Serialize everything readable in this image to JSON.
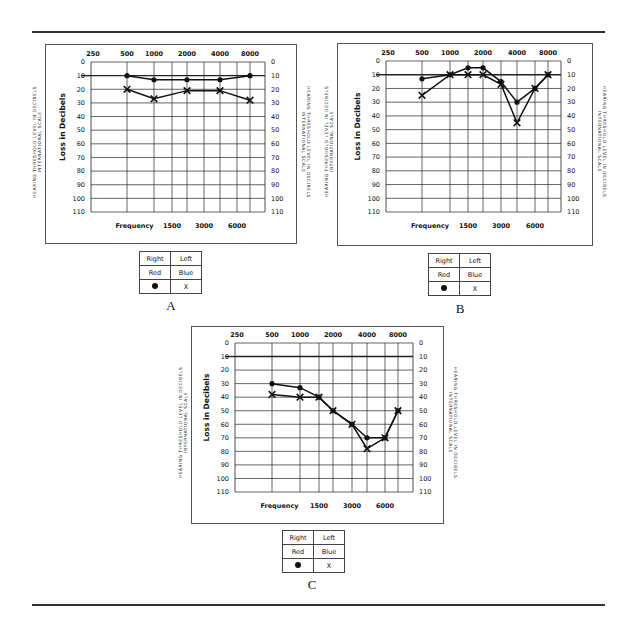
{
  "page": {
    "legend": {
      "right": "Right",
      "left": "Left",
      "right_color": "Red",
      "left_color": "Blue",
      "right_symbol": "●",
      "left_symbol": "X"
    },
    "axis_common": {
      "top_freq_labels": [
        "250",
        "500",
        "1000",
        "2000",
        "4000",
        "8000"
      ],
      "bottom_freq_labels": [
        "1500",
        "3000",
        "6000"
      ],
      "frequency_label": "Frequency",
      "db_ticks": [
        "0",
        "10",
        "20",
        "30",
        "40",
        "50",
        "60",
        "70",
        "80",
        "90",
        "100",
        "110"
      ],
      "inner_ylabel": "Loss in Decibels",
      "outer_ylabel_line1": "HEARING THRESHOLD LEVEL IN DECIBELS",
      "outer_ylabel_line2": "INTERNATIONAL SCALE"
    },
    "panels": [
      {
        "label": "A"
      },
      {
        "label": "B"
      },
      {
        "label": "C"
      }
    ]
  },
  "chart_data": [
    {
      "type": "line",
      "title": "A",
      "xlabel": "Frequency",
      "ylabel": "Loss in Decibels",
      "ylim": [
        0,
        110
      ],
      "y_inverted": true,
      "reference_line_db": 10,
      "series": [
        {
          "name": "Right (Red, ●)",
          "x": [
            500,
            1000,
            2000,
            4000,
            8000
          ],
          "values": [
            10,
            13,
            13,
            13,
            10
          ]
        },
        {
          "name": "Left (Blue, X)",
          "x": [
            500,
            1000,
            2000,
            4000,
            8000
          ],
          "values": [
            20,
            27,
            21,
            21,
            28
          ]
        }
      ]
    },
    {
      "type": "line",
      "title": "B",
      "xlabel": "Frequency",
      "ylabel": "Loss in Decibels",
      "ylim": [
        0,
        110
      ],
      "y_inverted": true,
      "reference_line_db": 10,
      "series": [
        {
          "name": "Right (Red, ●)",
          "x": [
            500,
            1000,
            1500,
            2000,
            3000,
            4000,
            6000,
            8000
          ],
          "values": [
            13,
            10,
            5,
            5,
            15,
            30,
            20,
            10
          ]
        },
        {
          "name": "Left (Blue, X)",
          "x": [
            500,
            1000,
            1500,
            2000,
            3000,
            4000,
            6000,
            8000
          ],
          "values": [
            25,
            10,
            10,
            10,
            17,
            45,
            20,
            10
          ]
        }
      ]
    },
    {
      "type": "line",
      "title": "C",
      "xlabel": "Frequency",
      "ylabel": "Loss in Decibels",
      "ylim": [
        0,
        110
      ],
      "y_inverted": true,
      "reference_line_db": 10,
      "series": [
        {
          "name": "Right (Red, ●)",
          "x": [
            500,
            1000,
            1500,
            2000,
            3000,
            4000,
            6000,
            8000
          ],
          "values": [
            30,
            33,
            40,
            50,
            60,
            70,
            70,
            50
          ]
        },
        {
          "name": "Left (Blue, X)",
          "x": [
            500,
            1000,
            1500,
            2000,
            3000,
            4000,
            6000,
            8000
          ],
          "values": [
            38,
            40,
            40,
            50,
            60,
            78,
            70,
            50
          ]
        }
      ]
    }
  ]
}
